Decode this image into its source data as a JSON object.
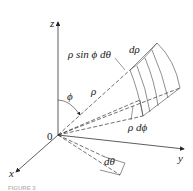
{
  "figure": {
    "type": "spherical coordinate volume element diagram",
    "axes": {
      "x": "x",
      "y": "y",
      "z": "z",
      "origin": "0"
    },
    "labels": {
      "rho_sin_phi_dtheta": "ρ sin ϕ dθ",
      "d_rho": "dρ",
      "rho": "ρ",
      "phi": "ϕ",
      "rho_dphi": "ρ dϕ",
      "dtheta": "dθ"
    },
    "caption": "FIGURE 3"
  }
}
